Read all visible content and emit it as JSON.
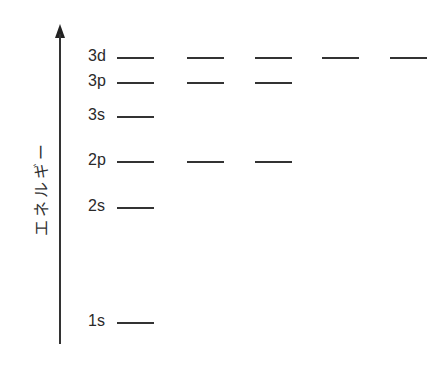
{
  "diagram": {
    "title": "",
    "axis": {
      "label": "エネルギー",
      "direction": "up",
      "arrow": true
    },
    "levels": [
      {
        "name": "3d",
        "orbitals": 5,
        "y": 57
      },
      {
        "name": "3p",
        "orbitals": 3,
        "y": 82
      },
      {
        "name": "3s",
        "orbitals": 1,
        "y": 116
      },
      {
        "name": "2p",
        "orbitals": 3,
        "y": 161
      },
      {
        "name": "2s",
        "orbitals": 1,
        "y": 207
      },
      {
        "name": "1s",
        "orbitals": 1,
        "y": 322
      }
    ],
    "orbital_columns_x": [
      117,
      187,
      255,
      322,
      390
    ],
    "line_width": 37,
    "colors": {
      "line": "#333333",
      "text": "#2a2a2a",
      "background": "#ffffff"
    }
  }
}
